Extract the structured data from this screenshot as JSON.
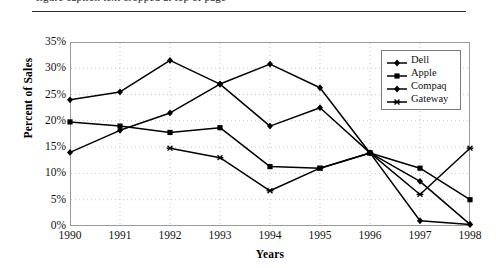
{
  "caption": {
    "partial_text": "figure caption text cropped at top of page"
  },
  "chart_data": {
    "type": "line",
    "title": "",
    "xlabel": "Years",
    "ylabel": "Percent of Sales",
    "categories": [
      "1990",
      "1991",
      "1992",
      "1993",
      "1994",
      "1995",
      "1996",
      "1997",
      "1998"
    ],
    "ylim": [
      0,
      35
    ],
    "ytick_labels": [
      "0%",
      "5%",
      "10%",
      "15%",
      "20%",
      "25%",
      "30%",
      "35%"
    ],
    "ytick_values": [
      0,
      5,
      10,
      15,
      20,
      25,
      30,
      35
    ],
    "grid": true,
    "legend_position": "top-right",
    "series": [
      {
        "name": "Dell",
        "marker": "diamond",
        "values": [
          14.0,
          18.2,
          21.5,
          27.0,
          30.8,
          26.3,
          13.9,
          8.5,
          0.3
        ]
      },
      {
        "name": "Apple",
        "marker": "square",
        "values": [
          19.8,
          19.0,
          17.8,
          18.7,
          11.3,
          11.0,
          13.9,
          11.0,
          5.0
        ]
      },
      {
        "name": "Compaq",
        "marker": "diamond",
        "values": [
          24.0,
          25.5,
          31.5,
          27.0,
          19.0,
          22.5,
          13.9,
          1.0,
          0.3
        ]
      },
      {
        "name": "Gateway",
        "marker": "asterisk",
        "values": [
          null,
          null,
          14.8,
          13.0,
          6.7,
          11.0,
          13.9,
          6.0,
          14.8
        ]
      }
    ]
  },
  "colors": {
    "series_line": "#000000",
    "axis": "#9a9a9a",
    "grid": "#b9b9b9",
    "text": "#111111",
    "background": "#ffffff"
  }
}
